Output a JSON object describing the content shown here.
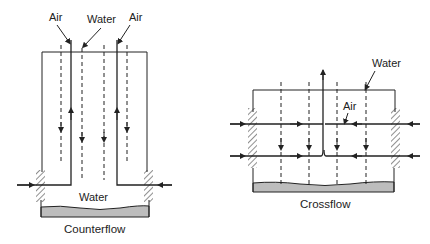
{
  "diagrams": [
    {
      "name": "counterflow",
      "caption": "Counterflow",
      "labels": {
        "air_left": "Air",
        "water_top": "Water",
        "air_right": "Air",
        "water_basin": "Water"
      }
    },
    {
      "name": "crossflow",
      "caption": "Crossflow",
      "labels": {
        "water_top": "Water",
        "air": "Air"
      }
    }
  ],
  "colors": {
    "line": "#222222",
    "basin_fill": "#bdbdbd",
    "background": "#ffffff"
  }
}
